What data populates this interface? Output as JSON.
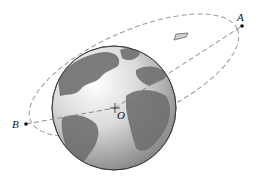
{
  "diagram": {
    "points": {
      "A": {
        "label": "A",
        "x": 242,
        "y": 26
      },
      "B": {
        "label": "B",
        "x": 26,
        "y": 124
      },
      "O": {
        "label": "O",
        "x": 115,
        "y": 108
      }
    },
    "earth": {
      "cx": 114,
      "cy": 108,
      "r": 62
    },
    "spacecraft": {
      "x": 180,
      "y": 37
    },
    "colors": {
      "orbit": "#9a9a9a",
      "ocean": "#d8d8d8",
      "land": "#6e6e6e",
      "point": "#111111"
    }
  }
}
